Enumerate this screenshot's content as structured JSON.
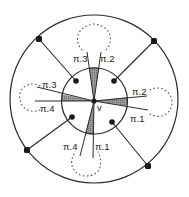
{
  "diagram": {
    "type": "graph-embedding-figure",
    "colors": {
      "stroke": "#2a2a2a",
      "shade": "#8c8c8c",
      "node": "#1a1a1a",
      "dotted": "#555555",
      "background": "#ffffff"
    },
    "outer_circle": {
      "cx": 94,
      "cy": 99,
      "r": 84
    },
    "inner_circle": {
      "cx": 94.5,
      "cy": 101,
      "r": 33
    },
    "center_vertex": {
      "label": "v",
      "x": 94,
      "y": 101
    },
    "outer_nodes": [
      {
        "x": 39,
        "y": 39
      },
      {
        "x": 154,
        "y": 41
      },
      {
        "x": 27,
        "y": 150
      },
      {
        "x": 148,
        "y": 166
      }
    ],
    "inner_nodes": [
      {
        "x": 76,
        "y": 81
      },
      {
        "x": 114,
        "y": 81
      },
      {
        "x": 72,
        "y": 117
      },
      {
        "x": 112,
        "y": 122
      }
    ],
    "dotted_loops": [
      {
        "name": "top",
        "cx": 94,
        "cy": 38,
        "rx": 16,
        "ry": 14
      },
      {
        "name": "left",
        "cx": 34,
        "cy": 98,
        "rx": 14,
        "ry": 14
      },
      {
        "name": "right",
        "cx": 160,
        "cy": 102,
        "rx": 13,
        "ry": 16
      },
      {
        "name": "bottom",
        "cx": 85,
        "cy": 163,
        "rx": 16,
        "ry": 13
      }
    ],
    "labels": {
      "top_left": "π.3",
      "top_right": "π.2",
      "left_upper": "π.3",
      "left_lower": "π.4",
      "right_upper": "π.2",
      "right_lower": "π.1",
      "bottom_left": "π.4",
      "bottom_right": "π.1",
      "center": "v"
    }
  }
}
